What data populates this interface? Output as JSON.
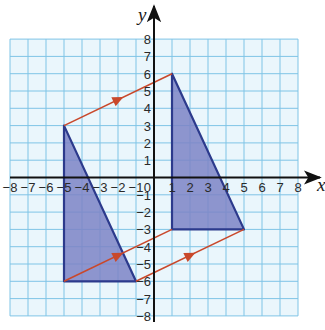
{
  "figure": {
    "type": "coordinate-grid-translation",
    "axes": {
      "x_label": "x",
      "y_label": "y",
      "x_range": [
        -8,
        8
      ],
      "y_range": [
        -8,
        8
      ],
      "origin_label": "0",
      "x_ticks": [
        "-8",
        "-7",
        "-6",
        "-5",
        "-4",
        "-3",
        "-2",
        "-1",
        "1",
        "2",
        "3",
        "4",
        "5",
        "6",
        "7",
        "8"
      ],
      "y_ticks": [
        "8",
        "7",
        "6",
        "5",
        "4",
        "3",
        "2",
        "1",
        "-1",
        "-2",
        "-3",
        "-4",
        "-5",
        "-6",
        "-7",
        "-8"
      ]
    },
    "shapes": [
      {
        "name": "object-triangle",
        "vertices": [
          [
            -5,
            3
          ],
          [
            -5,
            -6
          ],
          [
            -1,
            -6
          ]
        ]
      },
      {
        "name": "image-triangle",
        "vertices": [
          [
            1,
            6
          ],
          [
            1,
            -3
          ],
          [
            5,
            -3
          ]
        ]
      }
    ],
    "translation_arrows": [
      {
        "from": [
          -5,
          3
        ],
        "to": [
          1,
          6
        ]
      },
      {
        "from": [
          -5,
          -6
        ],
        "to": [
          1,
          -3
        ]
      },
      {
        "from": [
          -1,
          -6
        ],
        "to": [
          5,
          -3
        ]
      }
    ],
    "translation_vector": [
      6,
      3
    ],
    "colors": {
      "grid": "#7fc4e6",
      "grid_bg": "#eaf6fc",
      "shape_fill": "#7d84c6",
      "shape_edge": "#2c3a8c",
      "arrow": "#c9482b",
      "axis": "#111111"
    }
  }
}
